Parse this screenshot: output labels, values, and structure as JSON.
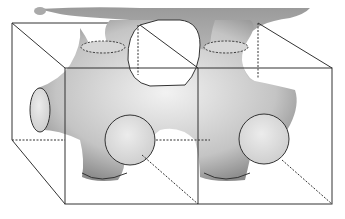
{
  "figure": {
    "colors": {
      "surface_light": "#e6e6e6",
      "surface_dark": "#8c8c8c",
      "edge": "#333333",
      "background": "#ffffff"
    }
  }
}
